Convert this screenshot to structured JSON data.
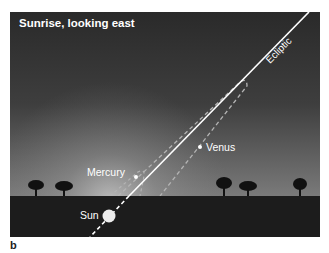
{
  "diagram": {
    "title": "Sunrise, looking east",
    "panel_letter": "b",
    "labels": {
      "ecliptic": "Ecliptic",
      "mercury": "Mercury",
      "venus": "Venus",
      "sun": "Sun"
    },
    "colors": {
      "sky_top": "#2b2b2b",
      "sky_horizon": "#8c8c8c",
      "ground": "#1c1c1c",
      "line": "#ffffff",
      "dashed_orbit": "#b4b4b4"
    }
  }
}
